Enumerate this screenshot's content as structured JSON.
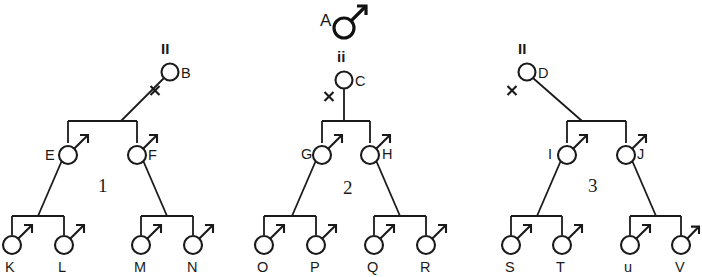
{
  "figure": {
    "kind": "pedigree-chart",
    "background_color": "#ffffff",
    "line_color": "#1a1a1a",
    "groups": [
      {
        "number_label": "1",
        "parent": {
          "id": "B",
          "sex_symbol": "female-symbol",
          "genotype": "II"
        },
        "generation2": [
          {
            "id": "E",
            "sex_symbol": "male-symbol"
          },
          {
            "id": "F",
            "sex_symbol": "male-symbol"
          }
        ],
        "generation3": [
          {
            "id": "K",
            "sex_symbol": "male-symbol"
          },
          {
            "id": "L",
            "sex_symbol": "male-symbol"
          },
          {
            "id": "M",
            "sex_symbol": "male-symbol"
          },
          {
            "id": "N",
            "sex_symbol": "male-symbol"
          }
        ]
      },
      {
        "number_label": "2",
        "founder": {
          "id": "A",
          "sex_symbol": "male-symbol"
        },
        "parent": {
          "id": "C",
          "sex_symbol": "female-symbol",
          "genotype": "ii"
        },
        "generation2": [
          {
            "id": "G",
            "sex_symbol": "male-symbol"
          },
          {
            "id": "H",
            "sex_symbol": "male-symbol"
          }
        ],
        "generation3": [
          {
            "id": "O",
            "sex_symbol": "male-symbol"
          },
          {
            "id": "P",
            "sex_symbol": "male-symbol"
          },
          {
            "id": "Q",
            "sex_symbol": "male-symbol"
          },
          {
            "id": "R",
            "sex_symbol": "male-symbol"
          }
        ]
      },
      {
        "number_label": "3",
        "parent": {
          "id": "D",
          "sex_symbol": "female-symbol",
          "genotype": "II"
        },
        "generation2": [
          {
            "id": "I",
            "sex_symbol": "male-symbol"
          },
          {
            "id": "J",
            "sex_symbol": "male-symbol"
          }
        ],
        "generation3": [
          {
            "id": "S",
            "sex_symbol": "male-symbol"
          },
          {
            "id": "T",
            "sex_symbol": "male-symbol"
          },
          {
            "id": "u",
            "sex_symbol": "male-symbol"
          },
          {
            "id": "V",
            "sex_symbol": "male-symbol"
          }
        ]
      }
    ],
    "labels": {
      "A": "A",
      "B": "B",
      "C": "C",
      "D": "D",
      "E": "E",
      "F": "F",
      "G": "G",
      "H": "H",
      "I": "I",
      "J": "J",
      "K": "K",
      "L": "L",
      "M": "M",
      "N": "N",
      "O": "O",
      "P": "P",
      "Q": "Q",
      "R": "R",
      "S": "S",
      "T": "T",
      "U": "u",
      "V": "V",
      "genotype_B": "II",
      "genotype_C": "ii",
      "genotype_D": "II",
      "group1": "1",
      "group2": "2",
      "group3": "3"
    }
  }
}
